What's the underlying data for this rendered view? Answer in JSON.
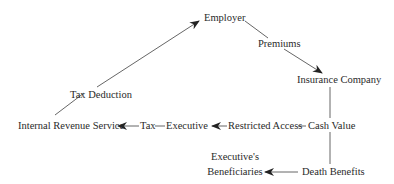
{
  "diagram": {
    "nodes": {
      "employer": "Employer",
      "premiums": "Premiums",
      "insurance_company": "Insurance Company",
      "tax_deduction": "Tax Deduction",
      "irs": "Internal Revenue Service",
      "tax": "Tax",
      "executive": "Executive",
      "restricted_access": "Restricted Access",
      "cash_value": "Cash Value",
      "beneficiaries_line1": "Executive's",
      "beneficiaries_line2": "Beneficiaries",
      "death_benefits": "Death Benefits"
    },
    "edges": [
      {
        "from": "Internal Revenue Service",
        "to": "Employer",
        "label": "Tax Deduction",
        "arrow": "to"
      },
      {
        "from": "Employer",
        "to": "Insurance Company",
        "label": "Premiums",
        "arrow": "to"
      },
      {
        "from": "Insurance Company",
        "to": "Cash Value",
        "label": "",
        "arrow": "none"
      },
      {
        "from": "Cash Value",
        "to": "Executive",
        "label": "Restricted Access",
        "arrow": "to"
      },
      {
        "from": "Executive",
        "to": "Internal Revenue Service",
        "label": "Tax",
        "arrow": "to"
      },
      {
        "from": "Cash Value",
        "to": "Death Benefits",
        "label": "",
        "arrow": "none"
      },
      {
        "from": "Death Benefits",
        "to": "Executive's Beneficiaries",
        "label": "",
        "arrow": "to"
      }
    ],
    "colors": {
      "line": "#555555",
      "text": "#2a2a2a",
      "background": "#ffffff"
    }
  }
}
